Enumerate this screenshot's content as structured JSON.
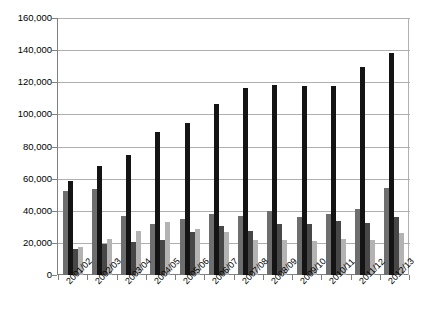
{
  "chart_data": {
    "type": "bar",
    "title": "",
    "subtitle": "",
    "xlabel": "",
    "ylabel": "",
    "ylim": [
      0,
      160000
    ],
    "ytick_step": 20000,
    "ytick_labels": [
      "160,000",
      "140,000",
      "120,000",
      "100,000",
      "80,000",
      "60,000",
      "40,000",
      "20,000",
      "0"
    ],
    "ytick_values": [
      160000,
      140000,
      120000,
      100000,
      80000,
      60000,
      40000,
      20000,
      0
    ],
    "grid": true,
    "grid_axis": "y",
    "legend": false,
    "legend_position": "none",
    "categories": [
      "2001/02",
      "2002/03",
      "2003/04",
      "2004/05",
      "2005/06",
      "2006/07",
      "2007/08",
      "2008/09",
      "2009/10",
      "2010/11",
      "2011/12",
      "2012/13"
    ],
    "series": [
      {
        "name": "Series 1",
        "color": "#6e6e6e",
        "values": [
          52000,
          53500,
          37000,
          32000,
          35000,
          38000,
          37000,
          40000,
          36000,
          38000,
          41000,
          54000
        ]
      },
      {
        "name": "Series 2",
        "color": "#141414",
        "values": [
          58500,
          68000,
          75000,
          89000,
          94500,
          106500,
          116500,
          118500,
          117500,
          117500,
          129500,
          138000
        ]
      },
      {
        "name": "Series 3",
        "color": "#474747",
        "values": [
          16000,
          19500,
          20500,
          21500,
          26500,
          30500,
          27500,
          31500,
          31500,
          33500,
          32500,
          36000
        ]
      },
      {
        "name": "Series 4",
        "color": "#b3b3b3",
        "values": [
          17500,
          22500,
          27500,
          33000,
          28500,
          27000,
          22000,
          22000,
          21000,
          22500,
          21500,
          26000
        ]
      }
    ]
  }
}
